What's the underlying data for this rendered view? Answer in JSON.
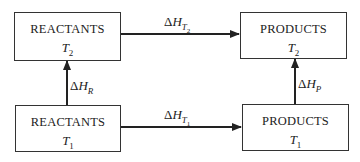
{
  "diagram": {
    "type": "enthalpy-cycle",
    "boxes": {
      "reactants_t2": {
        "title": "REACTANTS",
        "temp_symbol": "T",
        "temp_sub": "2"
      },
      "products_t2": {
        "title": "PRODUCTS",
        "temp_symbol": "T",
        "temp_sub": "2"
      },
      "reactants_t1": {
        "title": "REACTANTS",
        "temp_symbol": "T",
        "temp_sub": "1"
      },
      "products_t1": {
        "title": "PRODUCTS",
        "temp_symbol": "T",
        "temp_sub": "1"
      }
    },
    "arrows": {
      "top": {
        "delta": "Δ",
        "symbol": "H",
        "sub": "T",
        "subsub": "2",
        "from": "REACTANTS T2",
        "to": "PRODUCTS T2"
      },
      "bottom": {
        "delta": "Δ",
        "symbol": "H",
        "sub": "T",
        "subsub": "1",
        "from": "REACTANTS T1",
        "to": "PRODUCTS T1"
      },
      "left": {
        "delta": "Δ",
        "symbol": "H",
        "sub": "R",
        "from": "REACTANTS T1",
        "to": "REACTANTS T2"
      },
      "right": {
        "delta": "Δ",
        "symbol": "H",
        "sub": "P",
        "from": "PRODUCTS T1",
        "to": "PRODUCTS T2"
      }
    },
    "colors": {
      "line": "#222222",
      "background": "#ffffff"
    }
  }
}
